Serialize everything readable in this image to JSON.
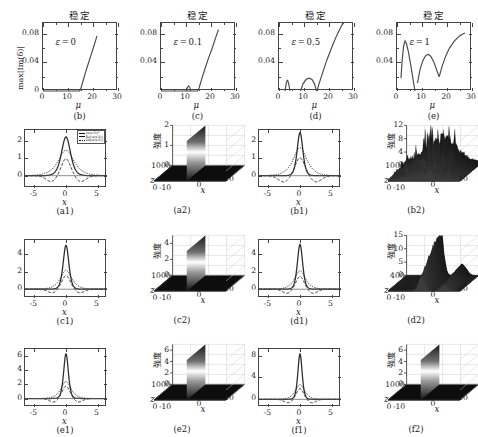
{
  "figure": {
    "title_stable": "稳定",
    "intensity_label": "強度",
    "ylabel_growth": "max|Im(δ)|",
    "xlabel_mu": "μ",
    "xlabel_x": "x",
    "xlabel_z": "z"
  },
  "legend": {
    "items": [
      {
        "style": "solid",
        "label": "|u(x,0)|²"
      },
      {
        "style": "dashed",
        "label": "Re[u(x,0)]"
      },
      {
        "style": "dotted",
        "label": "Im[u(x,0)]"
      }
    ]
  },
  "chart_data": [
    {
      "type": "line",
      "panel": "b",
      "caption": "(b)",
      "title": "稳定",
      "annotation": "ε = 0",
      "xlabel": "μ",
      "ylabel": "max|Im(δ)|",
      "xlim": [
        0,
        30
      ],
      "ylim": [
        0,
        0.095
      ],
      "xticks": [
        0,
        10,
        20,
        30
      ],
      "yticks": [
        0.04,
        0.08
      ],
      "grid": false,
      "series": [
        {
          "name": "growth-rate",
          "x": [
            0,
            5,
            10,
            14.6,
            15.2,
            16,
            17,
            18,
            19,
            20,
            21,
            21.6
          ],
          "y": [
            0,
            0,
            0,
            0,
            0.004,
            0.014,
            0.026,
            0.037,
            0.048,
            0.059,
            0.07,
            0.077
          ]
        }
      ]
    },
    {
      "type": "line",
      "panel": "c",
      "caption": "(c)",
      "title": "稳定",
      "annotation": "ε = 0.1",
      "xlabel": "μ",
      "ylabel": "",
      "xlim": [
        0,
        30
      ],
      "ylim": [
        0,
        0.095
      ],
      "xticks": [
        0,
        10,
        20,
        30
      ],
      "yticks": [
        0.04,
        0.08
      ],
      "grid": false,
      "series": [
        {
          "name": "growth-rate-main",
          "x": [
            0,
            5,
            10,
            14.6,
            15.3,
            16.2,
            17.5,
            19,
            20.5,
            22,
            23
          ],
          "y": [
            0,
            0,
            0,
            0,
            0.005,
            0.016,
            0.03,
            0.046,
            0.06,
            0.076,
            0.086
          ]
        },
        {
          "name": "growth-rate-bubble",
          "x": [
            10.1,
            10.5,
            11.0,
            11.5,
            11.9
          ],
          "y": [
            0,
            0.005,
            0.007,
            0.005,
            0
          ]
        }
      ]
    },
    {
      "type": "line",
      "panel": "d",
      "caption": "(d)",
      "title": "稳定",
      "annotation": "ε = 0.5",
      "xlabel": "μ",
      "ylabel": "",
      "xlim": [
        0,
        30
      ],
      "ylim": [
        0,
        0.095
      ],
      "xticks": [
        0,
        10,
        20,
        30
      ],
      "yticks": [
        0.04,
        0.08
      ],
      "grid": false,
      "series": [
        {
          "name": "lobe-1",
          "x": [
            2.4,
            2.9,
            3.3,
            3.6,
            4.0,
            4.4
          ],
          "y": [
            0,
            0.011,
            0.015,
            0.014,
            0.008,
            0
          ]
        },
        {
          "name": "lobe-2",
          "x": [
            8.6,
            9.6,
            10.8,
            12.0,
            13.2,
            14.2,
            15.0
          ],
          "y": [
            0,
            0.01,
            0.016,
            0.018,
            0.016,
            0.01,
            0
          ]
        },
        {
          "name": "growth-rate-main",
          "x": [
            15.2,
            16,
            17.5,
            19,
            21,
            23,
            25,
            26
          ],
          "y": [
            0,
            0.01,
            0.026,
            0.042,
            0.06,
            0.077,
            0.091,
            0.096
          ]
        }
      ]
    },
    {
      "type": "line",
      "panel": "e",
      "caption": "(e)",
      "title": "稳定",
      "annotation": "ε = 1",
      "xlabel": "μ",
      "ylabel": "",
      "xlim": [
        0,
        30
      ],
      "ylim": [
        0,
        0.095
      ],
      "xticks": [
        0,
        10,
        20,
        30
      ],
      "yticks": [
        0.04,
        0.08
      ],
      "grid": false,
      "series": [
        {
          "name": "lobe-1",
          "x": [
            1.6,
            2.0,
            2.6,
            3.2,
            3.8,
            4.6,
            5.6,
            6.6,
            7.2
          ],
          "y": [
            0.018,
            0.04,
            0.062,
            0.07,
            0.066,
            0.054,
            0.034,
            0.012,
            0
          ]
        },
        {
          "name": "lobe-2",
          "x": [
            8.2,
            9.2,
            10.4,
            11.6,
            12.6,
            13.6,
            14.8,
            16.0,
            16.9
          ],
          "y": [
            0.011,
            0.03,
            0.043,
            0.05,
            0.051,
            0.048,
            0.04,
            0.028,
            0.02
          ]
        },
        {
          "name": "growth-rate-main",
          "x": [
            16.9,
            18,
            19.5,
            21,
            23,
            25,
            26.5,
            27.2
          ],
          "y": [
            0.02,
            0.034,
            0.049,
            0.06,
            0.07,
            0.077,
            0.08,
            0.081
          ]
        }
      ]
    },
    {
      "type": "line",
      "panel": "a1",
      "caption": "(a1)",
      "xlabel": "x",
      "ylabel": "",
      "xlim": [
        -6.5,
        6.5
      ],
      "ylim": [
        -0.7,
        2.6
      ],
      "xticks": [
        -5,
        0,
        5
      ],
      "yticks": [
        0,
        1,
        2
      ],
      "peak_intensity": 2.2,
      "grid": false,
      "series": [
        {
          "name": "|u|^2",
          "style": "solid",
          "peak": 2.2,
          "width": 0.95
        },
        {
          "name": "Re(u)",
          "style": "dashed",
          "peak": 1.0,
          "trough": -0.42,
          "width": 1.2
        },
        {
          "name": "Im(u)",
          "style": "dotted",
          "peak": 1.45,
          "width": 1.1
        }
      ]
    },
    {
      "type": "surface",
      "panel": "a2",
      "caption": "(a2)",
      "zlabel": "強度",
      "xlabel": "x",
      "ylabel": "z",
      "xlim": [
        -10,
        10
      ],
      "ylim": [
        0,
        1000
      ],
      "zlim": [
        0,
        2
      ],
      "zticks": [
        0,
        1,
        2
      ],
      "yticks": [
        0,
        1000
      ],
      "xticks": [
        -10,
        0,
        10
      ],
      "behavior": "stable-propagation"
    },
    {
      "type": "line",
      "panel": "b1",
      "caption": "(b1)",
      "xlabel": "x",
      "ylabel": "",
      "xlim": [
        -6.5,
        6.5
      ],
      "ylim": [
        -0.7,
        2.6
      ],
      "xticks": [
        -5,
        0,
        5
      ],
      "yticks": [
        0,
        1,
        2
      ],
      "peak_intensity": 2.45,
      "grid": false,
      "series": [
        {
          "name": "|u|^2",
          "style": "solid",
          "peak": 2.45,
          "width": 0.6
        },
        {
          "name": "Re(u)",
          "style": "dashed",
          "peak": 1.05,
          "trough": -0.45,
          "width": 1.3
        },
        {
          "name": "Im(u)",
          "style": "dotted",
          "peak": 1.6,
          "width": 0.95
        }
      ]
    },
    {
      "type": "surface",
      "panel": "b2",
      "caption": "(b2)",
      "zlabel": "強度",
      "xlabel": "x",
      "ylabel": "z",
      "xlim": [
        -10,
        10
      ],
      "ylim": [
        0,
        1000
      ],
      "zlim": [
        0,
        12
      ],
      "zticks": [
        0,
        4,
        8,
        12
      ],
      "yticks": [
        0,
        1000
      ],
      "xticks": [
        -10,
        0,
        10
      ],
      "behavior": "unstable-chaotic"
    },
    {
      "type": "line",
      "panel": "c1",
      "caption": "(c1)",
      "xlabel": "x",
      "ylabel": "",
      "xlim": [
        -6.5,
        6.5
      ],
      "ylim": [
        -1.0,
        5.6
      ],
      "xticks": [
        -5,
        0,
        5
      ],
      "yticks": [
        0,
        2,
        4
      ],
      "peak_intensity": 5.0,
      "grid": false,
      "series": [
        {
          "name": "|u|^2",
          "style": "solid",
          "peak": 5.0,
          "width": 0.6
        },
        {
          "name": "Re(u)",
          "style": "dashed",
          "peak": 1.6,
          "trough": -0.55,
          "width": 1.1
        },
        {
          "name": "Im(u)",
          "style": "dotted",
          "peak": 2.15,
          "width": 0.8
        }
      ]
    },
    {
      "type": "surface",
      "panel": "c2",
      "caption": "(c2)",
      "zlabel": "強度",
      "xlabel": "x",
      "ylabel": "z",
      "xlim": [
        -10,
        10
      ],
      "ylim": [
        0,
        1000
      ],
      "zlim": [
        0,
        5
      ],
      "zticks": [
        0,
        2,
        4
      ],
      "yticks": [
        0,
        1000
      ],
      "xticks": [
        -10,
        0,
        10
      ],
      "behavior": "stable-propagation"
    },
    {
      "type": "line",
      "panel": "d1",
      "caption": "(d1)",
      "xlabel": "x",
      "ylabel": "",
      "xlim": [
        -6.5,
        6.5
      ],
      "ylim": [
        -1.0,
        5.6
      ],
      "xticks": [
        -5,
        0,
        5
      ],
      "yticks": [
        0,
        2,
        4
      ],
      "peak_intensity": 5.1,
      "grid": false,
      "series": [
        {
          "name": "|u|^2",
          "style": "solid",
          "peak": 5.1,
          "width": 0.55
        },
        {
          "name": "Re(u)",
          "style": "dashed",
          "peak": 1.5,
          "trough": -0.6,
          "width": 1.05
        },
        {
          "name": "Im(u)",
          "style": "dotted",
          "peak": 2.1,
          "width": 0.75
        }
      ]
    },
    {
      "type": "surface",
      "panel": "d2",
      "caption": "(d2)",
      "zlabel": "強度",
      "xlabel": "x",
      "ylabel": "z",
      "xlim": [
        -10,
        10
      ],
      "ylim": [
        0,
        400
      ],
      "zlim": [
        0,
        15
      ],
      "zticks": [
        0,
        5,
        10,
        15
      ],
      "yticks": [
        0,
        400
      ],
      "xticks": [
        -10,
        0,
        10
      ],
      "behavior": "unstable-collapse"
    },
    {
      "type": "line",
      "panel": "e1",
      "caption": "(e1)",
      "xlabel": "x",
      "ylabel": "",
      "xlim": [
        -6.5,
        6.5
      ],
      "ylim": [
        -1.2,
        7.0
      ],
      "xticks": [
        -5,
        0,
        5
      ],
      "yticks": [
        0,
        2,
        4,
        6
      ],
      "peak_intensity": 6.3,
      "grid": false,
      "series": [
        {
          "name": "|u|^2",
          "style": "solid",
          "peak": 6.3,
          "width": 0.5
        },
        {
          "name": "Re(u)",
          "style": "dashed",
          "peak": 1.8,
          "trough": -0.65,
          "width": 1.0
        },
        {
          "name": "Im(u)",
          "style": "dotted",
          "peak": 2.4,
          "width": 0.7
        }
      ]
    },
    {
      "type": "surface",
      "panel": "e2",
      "caption": "(e2)",
      "zlabel": "強度",
      "xlabel": "x",
      "ylabel": "z",
      "xlim": [
        -10,
        10
      ],
      "ylim": [
        0,
        1000
      ],
      "zlim": [
        0,
        7
      ],
      "zticks": [
        0,
        2,
        4,
        6
      ],
      "yticks": [
        0,
        1000
      ],
      "xticks": [
        -10,
        0,
        10
      ],
      "behavior": "stable-propagation"
    },
    {
      "type": "line",
      "panel": "f1",
      "caption": "(f1)",
      "xlabel": "x",
      "ylabel": "",
      "xlim": [
        -6.5,
        6.5
      ],
      "ylim": [
        -1.4,
        9.2
      ],
      "xticks": [
        -5,
        0,
        5
      ],
      "yticks": [
        0,
        4,
        8
      ],
      "peak_intensity": 8.3,
      "grid": false,
      "series": [
        {
          "name": "|u|^2",
          "style": "solid",
          "peak": 8.3,
          "width": 0.45
        },
        {
          "name": "Re(u)",
          "style": "dashed",
          "peak": 2.0,
          "trough": -0.8,
          "width": 0.95
        },
        {
          "name": "Im(u)",
          "style": "dotted",
          "peak": 2.7,
          "width": 0.65
        }
      ]
    },
    {
      "type": "surface",
      "panel": "f2",
      "caption": "(f2)",
      "zlabel": "強度",
      "xlabel": "x",
      "ylabel": "z",
      "xlim": [
        -10,
        10
      ],
      "ylim": [
        0,
        1000
      ],
      "zlim": [
        0,
        7
      ],
      "zticks": [
        0,
        2,
        4,
        6
      ],
      "yticks": [
        0,
        1000
      ],
      "xticks": [
        -10,
        0,
        10
      ],
      "behavior": "stable-propagation"
    }
  ]
}
